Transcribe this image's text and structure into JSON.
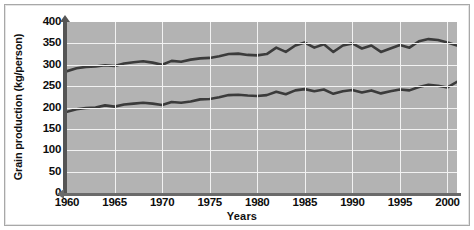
{
  "chart_data": {
    "type": "line",
    "title": "",
    "xlabel": "Years",
    "ylabel": "Grain production (kg/person)",
    "xlim": [
      1960,
      2001
    ],
    "ylim": [
      0,
      400
    ],
    "ytick_labels": [
      "400",
      "350",
      "300",
      "250",
      "200",
      "150",
      "100",
      "50",
      "0"
    ],
    "ytick_values": [
      400,
      350,
      300,
      250,
      200,
      150,
      100,
      50,
      0
    ],
    "xtick_labels": [
      "1960",
      "1965",
      "1970",
      "1975",
      "1980",
      "1985",
      "1990",
      "1995",
      "2000"
    ],
    "xtick_values": [
      1960,
      1965,
      1970,
      1975,
      1980,
      1985,
      1990,
      1995,
      2000
    ],
    "grid": true,
    "grid_color": "#f2f2f2",
    "plot_background": "#b3b3b3",
    "line_color": "#3b3b3b",
    "legend": [],
    "x": [
      1960,
      1961,
      1962,
      1963,
      1964,
      1965,
      1966,
      1967,
      1968,
      1969,
      1970,
      1971,
      1972,
      1973,
      1974,
      1975,
      1976,
      1977,
      1978,
      1979,
      1980,
      1981,
      1982,
      1983,
      1984,
      1985,
      1986,
      1987,
      1988,
      1989,
      1990,
      1991,
      1992,
      1993,
      1994,
      1995,
      1996,
      1997,
      1998,
      1999,
      2000,
      2001
    ],
    "series": [
      {
        "name": "upper-line",
        "values": [
          285,
          292,
          295,
          296,
          299,
          297,
          303,
          306,
          308,
          305,
          300,
          309,
          307,
          312,
          315,
          316,
          320,
          325,
          326,
          323,
          322,
          325,
          340,
          330,
          345,
          352,
          340,
          348,
          330,
          345,
          350,
          338,
          345,
          330,
          338,
          346,
          340,
          355,
          360,
          358,
          352,
          345
        ]
      },
      {
        "name": "lower-line",
        "values": [
          190,
          196,
          199,
          200,
          205,
          202,
          207,
          209,
          211,
          209,
          206,
          213,
          211,
          214,
          219,
          220,
          224,
          229,
          230,
          228,
          227,
          229,
          237,
          231,
          240,
          243,
          238,
          242,
          232,
          238,
          241,
          235,
          240,
          233,
          238,
          242,
          240,
          248,
          253,
          251,
          247,
          260
        ]
      }
    ]
  }
}
